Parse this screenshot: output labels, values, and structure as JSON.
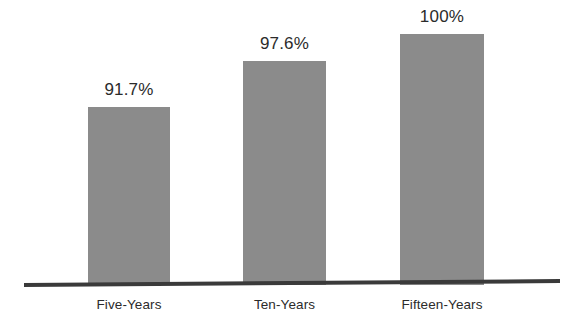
{
  "chart_data": {
    "type": "bar",
    "title": "",
    "subtitle": "",
    "xlabel": "",
    "ylabel": "",
    "categories": [
      "Five-Years",
      "Ten-Years",
      "Fifteen-Years"
    ],
    "values": [
      91.7,
      97.6,
      100
    ],
    "value_labels": [
      "91.7%",
      "97.6%",
      "100%"
    ],
    "ylim": [
      0,
      100
    ],
    "grid": false,
    "legend": "none",
    "bar_color": "#8b8b8b",
    "axis_color": "#3a3a3a",
    "text_color": "#2b2b2b",
    "background": "#ffffff",
    "annotations": []
  },
  "bars": [
    {
      "category": "Five-Years",
      "value": 91.7,
      "label": "91.7%"
    },
    {
      "category": "Ten-Years",
      "value": 97.6,
      "label": "97.6%"
    },
    {
      "category": "Fifteen-Years",
      "value": 100,
      "label": "100%"
    }
  ]
}
